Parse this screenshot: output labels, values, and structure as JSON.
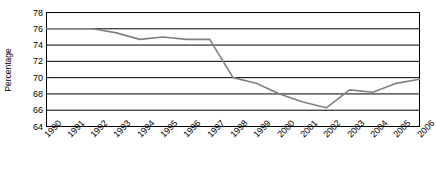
{
  "chart_data": {
    "type": "line",
    "title": "",
    "subtitle": "",
    "xlabel": "",
    "ylabel": "Percentage",
    "categories": [
      "1990",
      "1991",
      "1992",
      "1993",
      "1994",
      "1995",
      "1996",
      "1997",
      "1998",
      "1999",
      "2000",
      "2001",
      "2002",
      "2003",
      "2004",
      "2005",
      "2006"
    ],
    "x": [
      1990,
      1991,
      1992,
      1993,
      1994,
      1995,
      1996,
      1997,
      1998,
      1999,
      2000,
      2001,
      2002,
      2003,
      2004,
      2005,
      2006
    ],
    "values": [
      76.0,
      76.0,
      76.0,
      75.5,
      74.7,
      75.0,
      74.7,
      74.7,
      70.0,
      69.3,
      68.0,
      67.0,
      66.3,
      68.5,
      68.2,
      69.3,
      69.8
    ],
    "series": [
      {
        "name": "Percentage",
        "color": "#808080",
        "values": [
          76.0,
          76.0,
          76.0,
          75.5,
          74.7,
          75.0,
          74.7,
          74.7,
          70.0,
          69.3,
          68.0,
          67.0,
          66.3,
          68.5,
          68.2,
          69.3,
          69.8
        ]
      }
    ],
    "ylim": [
      64,
      78
    ],
    "yticks": [
      64,
      66,
      68,
      70,
      72,
      74,
      76,
      78
    ],
    "ytick_labels": [
      "64",
      "66",
      "68",
      "70",
      "72",
      "74",
      "76",
      "78"
    ],
    "xlim": [
      1990,
      2006
    ],
    "grid": "horizontal",
    "legend": "none",
    "colors": {
      "line": "#808080",
      "axis": "#000000",
      "grid": "#000000",
      "background": "#ffffff",
      "text": "#000000"
    }
  }
}
